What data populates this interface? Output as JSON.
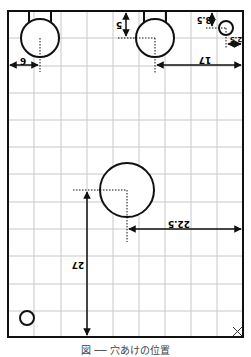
{
  "diagram": {
    "type": "drill-hole position drawing on grid",
    "board": {
      "left": 8,
      "top": 11,
      "right": 243,
      "bottom": 337
    },
    "grid": {
      "vertical_lines": [
        34,
        61,
        87,
        113,
        139,
        165,
        191,
        217
      ],
      "horizontal_lines": [
        38,
        66,
        93,
        120,
        147,
        174,
        202,
        229,
        256,
        284,
        311
      ],
      "color": "#c8c8c8"
    },
    "holes": [
      {
        "id": "hole-top-left",
        "cx": 40,
        "cy": 38,
        "r": 19,
        "tab": true
      },
      {
        "id": "hole-top-center",
        "cx": 155,
        "cy": 38,
        "r": 19,
        "tab": true
      },
      {
        "id": "hole-top-right",
        "cx": 226,
        "cy": 28,
        "r": 7,
        "tab": false
      },
      {
        "id": "hole-center",
        "cx": 127,
        "cy": 190,
        "r": 27,
        "tab": false
      },
      {
        "id": "hole-bottom-left",
        "cx": 27,
        "cy": 318,
        "r": 7,
        "tab": false
      }
    ],
    "dimensions": [
      {
        "id": "dim-6",
        "label": "6"
      },
      {
        "id": "dim-5",
        "label": "5"
      },
      {
        "id": "dim-3-5",
        "label": "3.5"
      },
      {
        "id": "dim-2-5",
        "label": "2.5"
      },
      {
        "id": "dim-17",
        "label": "17"
      },
      {
        "id": "dim-22-5",
        "label": "22.5"
      },
      {
        "id": "dim-27",
        "label": "27"
      }
    ],
    "corner_mark": "×",
    "line_color": "#111111",
    "caption": "図 ── 穴あけの位置"
  }
}
